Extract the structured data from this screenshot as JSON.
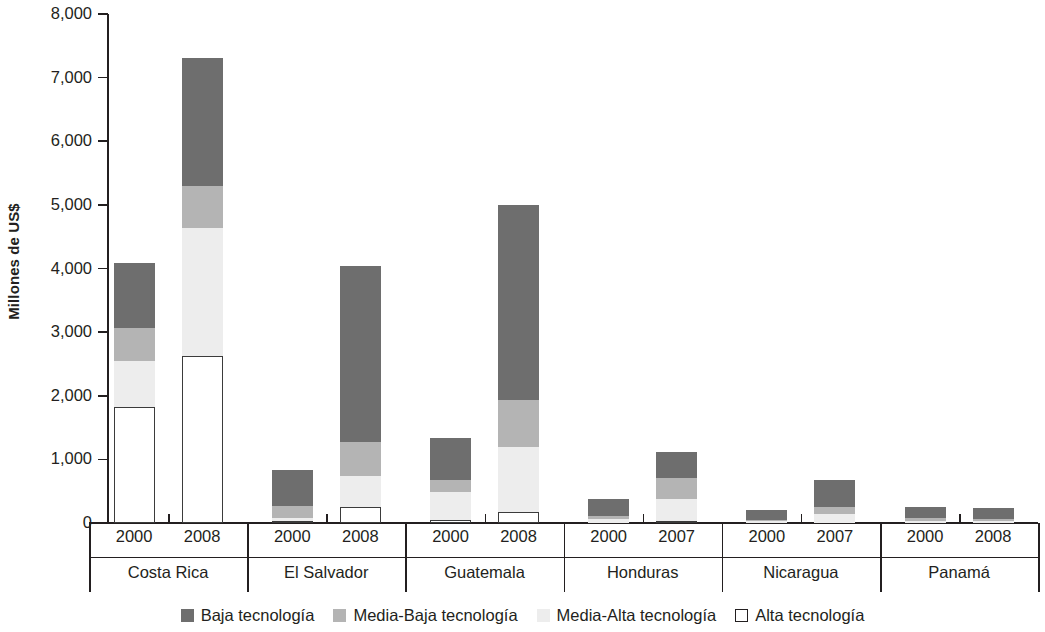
{
  "chart_data": {
    "type": "bar",
    "subtype": "stacked-bar-grouped",
    "title": "",
    "xlabel": "",
    "ylabel": "Millones de US$",
    "ylim": [
      0,
      8000
    ],
    "ytick_step": 1000,
    "ytick_labels": [
      "0",
      "1,000",
      "2,000",
      "3,000",
      "4,000",
      "5,000",
      "6,000",
      "7,000",
      "8,000"
    ],
    "ytick_values": [
      0,
      1000,
      2000,
      3000,
      4000,
      5000,
      6000,
      7000,
      8000
    ],
    "grid": false,
    "legend_position": "bottom",
    "stack_order_bottom_to_top": [
      "Alta tecnología",
      "Media-Alta tecnología",
      "Media-Baja tecnología",
      "Baja tecnología"
    ],
    "groups": [
      "Costa Rica",
      "El Salvador",
      "Guatemala",
      "Honduras",
      "Nicaragua",
      "Panamá"
    ],
    "categories": [
      {
        "group": "Costa Rica",
        "year": "2000"
      },
      {
        "group": "Costa Rica",
        "year": "2008"
      },
      {
        "group": "El Salvador",
        "year": "2000"
      },
      {
        "group": "El Salvador",
        "year": "2008"
      },
      {
        "group": "Guatemala",
        "year": "2000"
      },
      {
        "group": "Guatemala",
        "year": "2008"
      },
      {
        "group": "Honduras",
        "year": "2000"
      },
      {
        "group": "Honduras",
        "year": "2007"
      },
      {
        "group": "Nicaragua",
        "year": "2000"
      },
      {
        "group": "Nicaragua",
        "year": "2007"
      },
      {
        "group": "Panamá",
        "year": "2000"
      },
      {
        "group": "Panamá",
        "year": "2008"
      }
    ],
    "series": [
      {
        "name": "Alta tecnología",
        "color": "#ffffff",
        "border": "#3b3b3b",
        "values": [
          1830,
          2620,
          25,
          245,
          55,
          180,
          0,
          25,
          0,
          0,
          0,
          0
        ]
      },
      {
        "name": "Media-Alta tecnología",
        "color": "#ededed",
        "values": [
          720,
          2010,
          55,
          495,
          435,
          1010,
          70,
          355,
          25,
          135,
          30,
          25
        ]
      },
      {
        "name": "Media-Baja tecnología",
        "color": "#b4b4b4",
        "values": [
          520,
          660,
          185,
          530,
          190,
          740,
          45,
          320,
          20,
          110,
          45,
          40
        ]
      },
      {
        "name": "Baja tecnología",
        "color": "#6e6e6e",
        "values": [
          1020,
          2020,
          575,
          2770,
          650,
          3070,
          265,
          410,
          160,
          425,
          175,
          165
        ]
      }
    ],
    "totals": [
      4090,
      7310,
      840,
      4040,
      1330,
      5000,
      380,
      1110,
      205,
      670,
      250,
      230
    ]
  },
  "legend": {
    "items": [
      {
        "label": "Baja tecnología",
        "swatch": "baja"
      },
      {
        "label": "Media-Baja tecnología",
        "swatch": "media-baja"
      },
      {
        "label": "Media-Alta tecnología",
        "swatch": "media-alta"
      },
      {
        "label": "Alta tecnología",
        "swatch": "alta"
      }
    ]
  }
}
